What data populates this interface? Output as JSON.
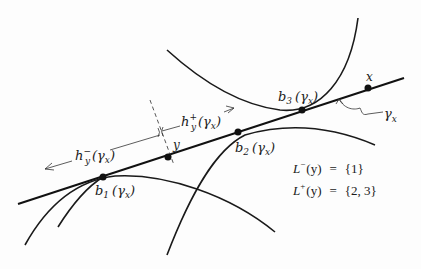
{
  "diagram": {
    "curve_label": "γ",
    "curve_label_sub": "x",
    "points": [
      {
        "id": "b1",
        "name": "b",
        "sub": "1",
        "arg": "(γ",
        "arg_sub": "x",
        "close": ")"
      },
      {
        "id": "y",
        "name": "y"
      },
      {
        "id": "b2",
        "name": "b",
        "sub": "2",
        "arg": "(γ",
        "arg_sub": "x",
        "close": ")"
      },
      {
        "id": "b3",
        "name": "b",
        "sub": "3",
        "arg": "(γ",
        "arg_sub": "x",
        "close": ")"
      },
      {
        "id": "x",
        "name": "x"
      }
    ],
    "half_lines": {
      "minus": {
        "name": "h",
        "sup": "−",
        "sub": "y",
        "arg": "(γ",
        "arg_sub": "x",
        "close": ")"
      },
      "plus": {
        "name": "h",
        "sup": "+",
        "sub": "y",
        "arg": "(γ",
        "arg_sub": "x",
        "close": ")"
      }
    },
    "sets": {
      "minus": {
        "name": "L",
        "sup": "−",
        "arg": "(y)",
        "eq": "=",
        "value": "{1}"
      },
      "plus": {
        "name": "L",
        "sup": "+",
        "arg": "(y)",
        "eq": "=",
        "value": "{2, 3}"
      }
    }
  }
}
